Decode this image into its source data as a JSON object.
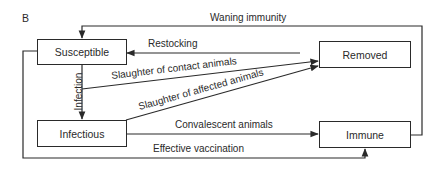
{
  "panel_label": "B",
  "nodes": {
    "susceptible": "Susceptible",
    "infectious": "Infectious",
    "removed": "Removed",
    "immune": "Immune"
  },
  "edges": {
    "waning_immunity": "Waning immunity",
    "restocking": "Restocking",
    "infection": "Infection",
    "slaughter_contact": "Slaughter of contact animals",
    "slaughter_affected": "Slaughter of affected animals",
    "convalescent": "Convalescent animals",
    "effective_vaccination": "Effective vaccination"
  },
  "colors": {
    "line": "#2a2a2a",
    "background": "#ffffff"
  }
}
